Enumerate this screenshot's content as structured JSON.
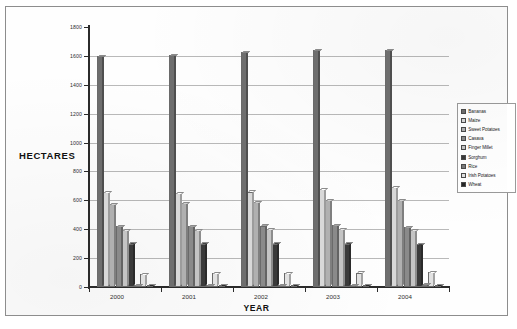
{
  "chart_data": {
    "type": "bar",
    "title": "",
    "xlabel": "YEAR",
    "ylabel": "HECTARES",
    "ylim": [
      0,
      1800
    ],
    "ytick_step": 200,
    "yticks": [
      "0",
      "200",
      "400",
      "600",
      "800",
      "1000",
      "1200",
      "1400",
      "1600",
      "1800"
    ],
    "grid": true,
    "legend_position": "right",
    "categories": [
      "2000",
      "2001",
      "2002",
      "2003",
      "2004"
    ],
    "series": [
      {
        "name": "Bananas",
        "color": "#6e6e6e",
        "values": [
          1600,
          1605,
          1625,
          1640,
          1640
        ]
      },
      {
        "name": "Maize",
        "color": "#d8d8d8",
        "values": [
          655,
          650,
          660,
          680,
          690
        ]
      },
      {
        "name": "Sweet Potatoes",
        "color": "#b0b0b0",
        "values": [
          575,
          580,
          590,
          600,
          600
        ]
      },
      {
        "name": "Casava",
        "color": "#8a8a8a",
        "values": [
          420,
          420,
          425,
          430,
          415
        ]
      },
      {
        "name": "Finger Millet",
        "color": "#c4c4c4",
        "values": [
          395,
          395,
          400,
          400,
          395
        ]
      },
      {
        "name": "Sorghum",
        "color": "#3a3a3a",
        "values": [
          300,
          300,
          300,
          300,
          295
        ]
      },
      {
        "name": "Rice",
        "color": "#7a7a7a",
        "values": [
          12,
          12,
          14,
          16,
          18
        ]
      },
      {
        "name": "Irish Potatoes",
        "color": "#e2e2e2",
        "values": [
          92,
          95,
          98,
          100,
          102
        ]
      },
      {
        "name": "Wheat",
        "color": "#262626",
        "values": [
          12,
          12,
          12,
          12,
          12
        ]
      }
    ]
  }
}
